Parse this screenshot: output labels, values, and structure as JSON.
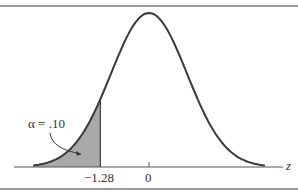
{
  "chart_data": {
    "type": "area",
    "title": "",
    "xlabel": "z",
    "ylabel": "",
    "distribution": "standard normal",
    "x_ticks": [
      {
        "value": -1.28,
        "label": "−1.28"
      },
      {
        "value": 0,
        "label": "0"
      }
    ],
    "shaded_region": {
      "from": "-inf",
      "to": -1.28,
      "area": 0.1
    },
    "annotation": "α = .10",
    "xlim": [
      -3.5,
      3.5
    ],
    "grid": false,
    "legend": null
  },
  "labels": {
    "alpha": "α = .10",
    "critical": "−1.28",
    "zero": "0",
    "axis": "z"
  },
  "colors": {
    "curve": "#3a3a3a",
    "shade": "#a9a9a9",
    "border": "#7a7a7a"
  }
}
